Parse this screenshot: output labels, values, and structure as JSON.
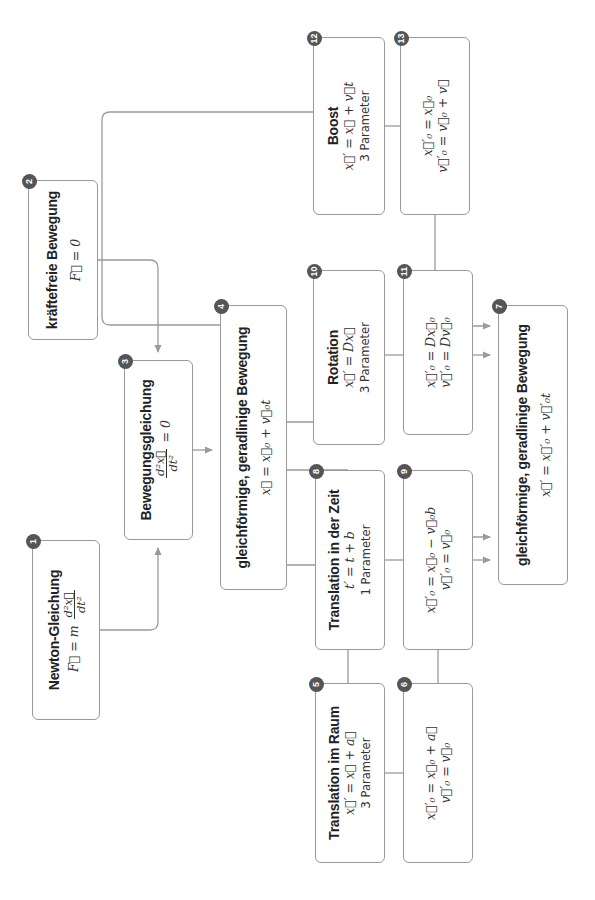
{
  "diagram": {
    "orientation": "rotated 90° counter-clockwise",
    "edge_color": "#9a9a9a",
    "badge_color": "#555555",
    "nodes": {
      "n1": {
        "badge": "1",
        "title": "Newton-Gleichung",
        "formula_lhs": "F⃗ = m",
        "frac_num": "d²x⃗",
        "frac_den": "dt²"
      },
      "n2": {
        "badge": "2",
        "title": "kräftefreie Bewegung",
        "formula": "F⃗ = 0"
      },
      "n3": {
        "badge": "3",
        "title": "Bewegungsgleichung",
        "frac_num": "d²x⃗",
        "frac_den": "dt²",
        "formula_rhs": "= 0"
      },
      "n4": {
        "badge": "4",
        "title": "gleichförmige, geradlinige Bewegung",
        "formula": "x⃗ = x⃗₀ + v⃗₀t"
      },
      "n5": {
        "badge": "5",
        "title": "Translation im Raum",
        "formula": "x⃗′ = x⃗ + a⃗",
        "params": "3 Parameter"
      },
      "n6": {
        "badge": "6",
        "line1": "x⃗′₀ = x⃗₀ + a⃗",
        "line2": "v⃗′₀ = v⃗₀"
      },
      "n7": {
        "badge": "7",
        "title": "gleichförmige, geradlinige Bewegung",
        "formula": "x⃗′ = x⃗′₀ + v⃗′₀t"
      },
      "n8": {
        "badge": "8",
        "title": "Translation in der Zeit",
        "formula": "t′ = t + b",
        "params": "1 Parameter"
      },
      "n9": {
        "badge": "9",
        "line1": "x⃗′₀ = x⃗₀ − v⃗₀b",
        "line2": "v⃗′₀ = v⃗₀"
      },
      "n10": {
        "badge": "10",
        "title": "Rotation",
        "formula": "x⃗′ = Dx⃗",
        "params": "3 Parameter"
      },
      "n11": {
        "badge": "11",
        "line1": "x⃗′₀ = Dx⃗₀",
        "line2": "v⃗′₀ = Dv⃗₀"
      },
      "n12": {
        "badge": "12",
        "title": "Boost",
        "formula": "x⃗′ = x⃗ + v⃗t",
        "params": "3 Parameter"
      },
      "n13": {
        "badge": "13",
        "line1": "x⃗′₀ = x⃗₀",
        "line2": "v⃗′₀ = v⃗₀ + v⃗"
      }
    },
    "edges": [
      {
        "from": "1",
        "to": "3"
      },
      {
        "from": "2",
        "to": "3"
      },
      {
        "from": "3",
        "to": "4"
      },
      {
        "from": "4",
        "to": "5"
      },
      {
        "from": "4",
        "to": "8"
      },
      {
        "from": "4",
        "to": "10"
      },
      {
        "from": "4",
        "to": "12"
      },
      {
        "from": "5",
        "to": "6"
      },
      {
        "from": "8",
        "to": "9"
      },
      {
        "from": "10",
        "to": "11"
      },
      {
        "from": "12",
        "to": "13"
      },
      {
        "from": "6",
        "to": "7"
      },
      {
        "from": "9",
        "to": "7"
      },
      {
        "from": "11",
        "to": "7"
      },
      {
        "from": "13",
        "to": "7"
      }
    ]
  }
}
